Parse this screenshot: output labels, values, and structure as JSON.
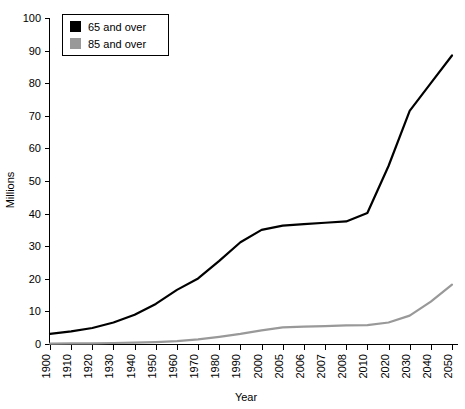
{
  "chart_data": {
    "type": "line",
    "title": "",
    "xlabel": "Year",
    "ylabel": "Millions",
    "ylim": [
      0,
      100
    ],
    "ytick_step": 10,
    "grid": false,
    "legend_position": "top-left",
    "categories": [
      "1900",
      "1910",
      "1920",
      "1930",
      "1940",
      "1950",
      "1960",
      "1970",
      "1980",
      "1990",
      "2000",
      "2005",
      "2006",
      "2007",
      "2008",
      "2010",
      "2020",
      "2030",
      "2040",
      "2050"
    ],
    "yticks": [
      "0",
      "10",
      "20",
      "30",
      "40",
      "50",
      "60",
      "70",
      "80",
      "90",
      "100"
    ],
    "series": [
      {
        "name": "65 and over",
        "color": "#000000",
        "values": [
          3.1,
          3.9,
          4.9,
          6.6,
          9.0,
          12.3,
          16.6,
          20.1,
          25.5,
          31.2,
          35.0,
          36.3,
          36.8,
          37.2,
          37.6,
          40.2,
          54.6,
          71.5,
          80.0,
          88.5
        ]
      },
      {
        "name": "85 and over",
        "color": "#999999",
        "values": [
          0.1,
          0.2,
          0.2,
          0.3,
          0.4,
          0.6,
          0.9,
          1.4,
          2.2,
          3.1,
          4.2,
          5.1,
          5.3,
          5.5,
          5.7,
          5.8,
          6.6,
          8.7,
          13.0,
          18.2
        ]
      }
    ]
  },
  "legend": {
    "items": [
      {
        "label": "65 and over",
        "swatch_color": "#000000"
      },
      {
        "label": "85 and over",
        "swatch_color": "#999999"
      }
    ]
  },
  "axes": {
    "y_title": "Millions",
    "x_title": "Year"
  }
}
